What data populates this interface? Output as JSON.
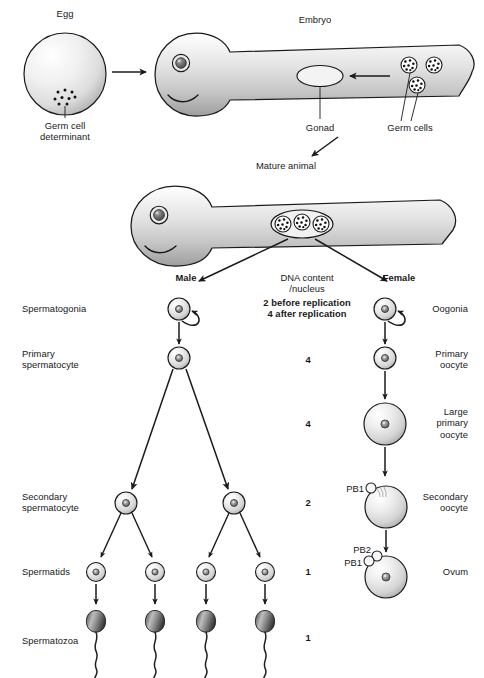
{
  "figure": {
    "type": "biology-diagram"
  },
  "top_row": {
    "egg_label": "Egg",
    "germ_cell_determinant_label": "Germ cell\ndeterminant",
    "embryo_label": "Embryo",
    "gonad_label": "Gonad",
    "germ_cells_label": "Germ cells"
  },
  "middle_row": {
    "mature_animal_label": "Mature animal"
  },
  "branch": {
    "male_label": "Male",
    "female_label": "Female",
    "dna_heading_line1": "DNA content",
    "dna_heading_line2": "/nucleus",
    "dna_note_line1": "2 before replication",
    "dna_note_line2": "4 after replication"
  },
  "male_stages": [
    {
      "label": "Spermatogonia",
      "y": 309
    },
    {
      "label": "Primary\nspermatocyte",
      "y": 354
    },
    {
      "label": "Secondary\nspermatocyte",
      "y": 497
    },
    {
      "label": "Spermatids",
      "y": 572
    },
    {
      "label": "Spermatozoa",
      "y": 641
    }
  ],
  "female_stages": [
    {
      "label": "Oogonia",
      "y": 309
    },
    {
      "label": "Primary\noocyte",
      "y": 354
    },
    {
      "label": "Large\nprimary\noocyte",
      "y": 417
    },
    {
      "label": "Secondary\noocyte",
      "y": 497
    },
    {
      "label": "Ovum",
      "y": 572
    }
  ],
  "dna_values": [
    {
      "value": "4",
      "y": 360
    },
    {
      "value": "4",
      "y": 424
    },
    {
      "value": "2",
      "y": 503
    },
    {
      "value": "1",
      "y": 572
    },
    {
      "value": "1",
      "y": 638
    }
  ],
  "polar_bodies": [
    {
      "label": "PB1",
      "x": 358,
      "y": 489
    },
    {
      "label": "PB2",
      "x": 358,
      "y": 550
    },
    {
      "label": "PB1",
      "x": 352,
      "y": 564
    }
  ],
  "colors": {
    "outline": "#1a1a1a",
    "cell_light": "#fbfbfb",
    "cell_mid": "#d2d2d2",
    "cell_dark": "#9a9a9a",
    "body_light": "#f2f2f2",
    "body_mid": "#cfcfcf",
    "body_dark": "#8e8e8e",
    "sperm_head_dark": "#4a4a4a",
    "sperm_head_light": "#b9b9b9",
    "nucleus": "#6d6d6d",
    "text": "#17181a",
    "background": "#ffffff"
  }
}
